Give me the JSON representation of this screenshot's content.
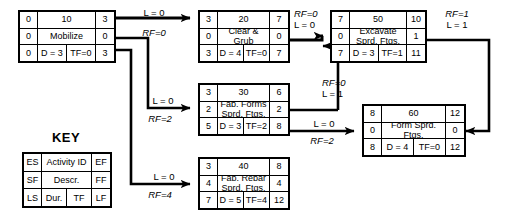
{
  "diagram": {
    "type": "precedence-network-diagram",
    "key_title": "KEY",
    "key_legend": {
      "row1": [
        "ES",
        "Activity ID",
        "EF"
      ],
      "row2": [
        "SF",
        "Descr.",
        "FF"
      ],
      "row3": [
        "LS",
        "Dur.",
        "TF",
        "LF"
      ]
    },
    "nodes": [
      {
        "id": "10",
        "es": "0",
        "ef": "3",
        "sf": "0",
        "ff": "0",
        "ls": "0",
        "lf": "3",
        "descr": "Mobilize",
        "dur": "D = 3",
        "tf": "TF=0"
      },
      {
        "id": "20",
        "es": "3",
        "ef": "7",
        "sf": "0",
        "ff": "0",
        "ls": "3",
        "lf": "7",
        "descr": "Clear & Grub",
        "dur": "D = 4",
        "tf": "TF=0"
      },
      {
        "id": "50",
        "es": "7",
        "ef": "10",
        "sf": "0",
        "ff": "1",
        "ls": "7",
        "lf": "11",
        "descr": "Excavate Sprd. Ftgs.",
        "dur": "D = 3",
        "tf": "TF=1"
      },
      {
        "id": "30",
        "es": "3",
        "ef": "6",
        "sf": "2",
        "ff": "2",
        "ls": "5",
        "lf": "8",
        "descr": "Fab. Forms Sprd. Ftgs.",
        "dur": "D = 3",
        "tf": "TF=2"
      },
      {
        "id": "40",
        "es": "3",
        "ef": "8",
        "sf": "4",
        "ff": "4",
        "ls": "7",
        "lf": "12",
        "descr": "Fab. Rebar Sprd. Ftgs.",
        "dur": "D = 5",
        "tf": "TF=4"
      },
      {
        "id": "60",
        "es": "8",
        "ef": "12",
        "sf": "0",
        "ff": "0",
        "ls": "8",
        "lf": "12",
        "descr": "Form Sprd. Ftgs.",
        "dur": "D = 4",
        "tf": "TF=0"
      }
    ],
    "links": [
      {
        "from": "10",
        "to": "20",
        "lag": "L = 0",
        "rf": "RF=0"
      },
      {
        "from": "10",
        "to": "30",
        "lag": "L = 0",
        "rf": "RF=2"
      },
      {
        "from": "10",
        "to": "40",
        "lag": "L = 0",
        "rf": "RF=4"
      },
      {
        "from": "20",
        "to": "50",
        "lag": "L = 0",
        "rf": "RF=0"
      },
      {
        "from": "30",
        "to": "50",
        "lag": "L = 1",
        "rf": "RF=0"
      },
      {
        "from": "30",
        "to": "60",
        "lag": "L = 0",
        "rf": "RF=2"
      },
      {
        "from": "50",
        "to": "60",
        "lag": "L = 1",
        "rf": "RF=1"
      }
    ],
    "colors": {
      "line": "#000000",
      "background": "#ffffff"
    }
  }
}
